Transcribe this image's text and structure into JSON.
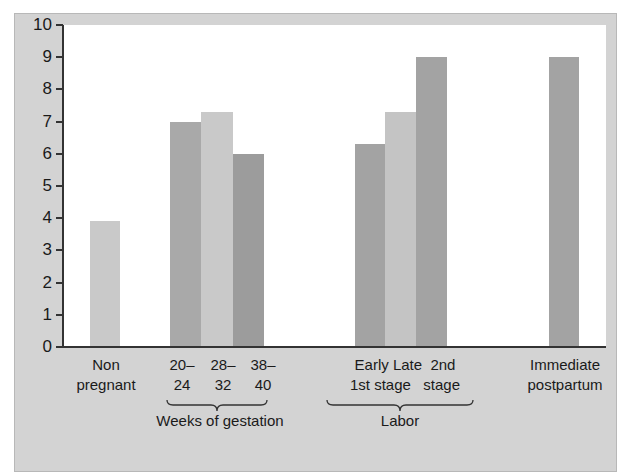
{
  "chart_data": {
    "type": "bar",
    "title": "",
    "xlabel": "",
    "ylabel": "",
    "ylim": [
      0,
      10
    ],
    "yticks": [
      0,
      1,
      2,
      3,
      4,
      5,
      6,
      7,
      8,
      9,
      10
    ],
    "grid": false,
    "legend": null,
    "categories": [
      "Non pregnant",
      "20–24",
      "28–32",
      "38–40",
      "Early 1st stage",
      "Late 1st stage",
      "2nd stage",
      "Immediate postpartum"
    ],
    "values": [
      3.9,
      7.0,
      7.3,
      6.0,
      6.3,
      7.3,
      9.0,
      9.0
    ],
    "groups": [
      {
        "label": "Weeks of gestation",
        "categories": [
          "20–24",
          "28–32",
          "38–40"
        ]
      },
      {
        "label": "Labor",
        "categories": [
          "Early 1st stage",
          "Late 1st stage",
          "2nd stage"
        ]
      }
    ],
    "bar_colors": [
      "#c9c9c9",
      "#a9a9a9",
      "#c9c9c9",
      "#9c9c9c",
      "#a3a3a3",
      "#c4c4c4",
      "#a3a3a3",
      "#a3a3a3"
    ]
  },
  "labels": {
    "nonpregnant_1": "Non",
    "nonpregnant_2": "pregnant",
    "g1_1": "20–",
    "g1_2": "24",
    "g2_1": "28–",
    "g2_2": "32",
    "g3_1": "38–",
    "g3_2": "40",
    "gestation_group": "Weeks of gestation",
    "labor_top": "Early Late  2nd",
    "labor_bottom": "1st stage   stage",
    "labor_group": "Labor",
    "postpartum_1": "Immediate",
    "postpartum_2": "postpartum"
  },
  "ticks": [
    "0",
    "1",
    "2",
    "3",
    "4",
    "5",
    "6",
    "7",
    "8",
    "9",
    "10"
  ]
}
